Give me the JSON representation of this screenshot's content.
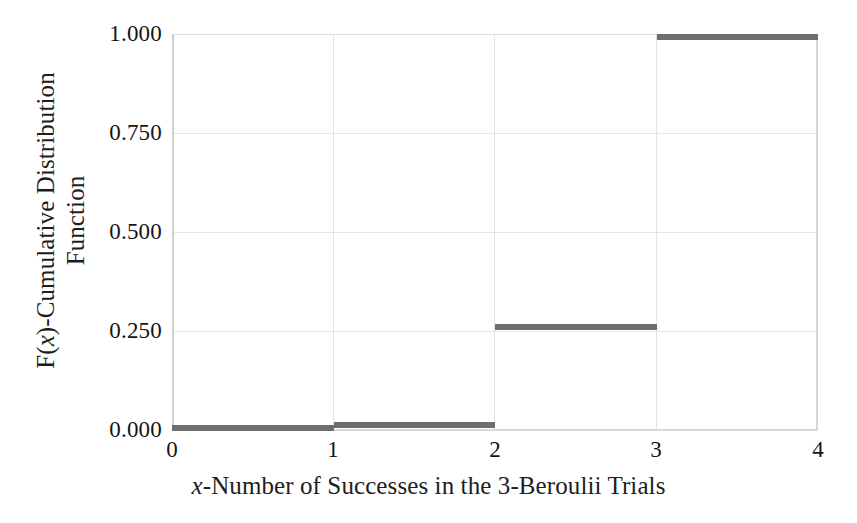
{
  "chart_data": {
    "type": "line",
    "subtype": "step",
    "title": "",
    "xlabel": "x-Number of Successes in the 3-Beroulii Trials",
    "xlabel_parts": {
      "italic": "x",
      "rest": "-Number of Successes in the 3-Beroulii Trials"
    },
    "ylabel": "F(x)-Cumulative Distribution Function",
    "ylabel_line1_prefix": "F(",
    "ylabel_line1_italic": "x",
    "ylabel_line1_suffix": ")-Cumulative Distribution",
    "ylabel_line2": "Function",
    "xlim": [
      0,
      4
    ],
    "ylim": [
      0.0,
      1.0
    ],
    "xticks": [
      0,
      1,
      2,
      3,
      4
    ],
    "xtick_labels": [
      "0",
      "1",
      "2",
      "3",
      "4"
    ],
    "yticks": [
      0.0,
      0.25,
      0.5,
      0.75,
      1.0
    ],
    "ytick_labels": [
      "0.000",
      "0.250",
      "0.500",
      "0.750",
      "1.000"
    ],
    "grid": true,
    "grid_axis": "both",
    "legend": false,
    "line_color": "#6e6e6e",
    "line_width_px": 6,
    "grid_color": "#e6e6e6",
    "background": "#ffffff",
    "steps": [
      {
        "x_start": 0,
        "x_end": 1,
        "y": 0.0,
        "label": "F(x)=0.000 for 0≤x<1"
      },
      {
        "x_start": 1,
        "x_end": 2,
        "y": 0.016,
        "label": "F(x)=0.016 for 1≤x<2"
      },
      {
        "x_start": 2,
        "x_end": 3,
        "y": 0.262,
        "label": "F(x)=0.262 for 2≤x<3"
      },
      {
        "x_start": 3,
        "x_end": 4,
        "y": 1.0,
        "label": "F(x)=1.000 for 3≤x≤4"
      }
    ],
    "x": [
      0,
      1,
      2,
      3,
      4
    ],
    "values": [
      0.0,
      0.016,
      0.262,
      1.0,
      1.0
    ]
  },
  "axes": {
    "y_ticks": [
      {
        "label": "1.000",
        "value": 1.0
      },
      {
        "label": "0.750",
        "value": 0.75
      },
      {
        "label": "0.500",
        "value": 0.5
      },
      {
        "label": "0.250",
        "value": 0.25
      },
      {
        "label": "0.000",
        "value": 0.0
      }
    ],
    "x_ticks": [
      {
        "label": "0",
        "value": 0
      },
      {
        "label": "1",
        "value": 1
      },
      {
        "label": "2",
        "value": 2
      },
      {
        "label": "3",
        "value": 3
      },
      {
        "label": "4",
        "value": 4
      }
    ]
  },
  "labels": {
    "y_title_line1_prefix": "F(",
    "y_title_line1_italic": "x",
    "y_title_line1_suffix": ")-Cumulative Distribution",
    "y_title_line2": "Function",
    "x_title_italic": "x",
    "x_title_rest": "-Number of Successes in the 3-Beroulii Trials"
  }
}
